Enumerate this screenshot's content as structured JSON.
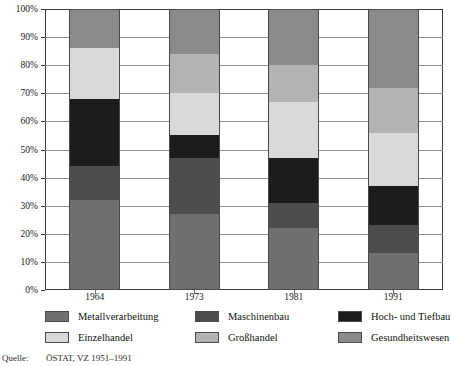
{
  "chart_data": {
    "type": "bar",
    "subtype": "stacked-100-percent",
    "title": "",
    "xlabel": "",
    "ylabel": "",
    "categories": [
      "1964",
      "1973",
      "1981",
      "1991"
    ],
    "ylim": [
      0,
      100
    ],
    "ytick_labels": [
      "0%",
      "10%",
      "20%",
      "30%",
      "40%",
      "50%",
      "60%",
      "70%",
      "80%",
      "90%",
      "100%"
    ],
    "ytick_values": [
      0,
      10,
      20,
      30,
      40,
      50,
      60,
      70,
      80,
      90,
      100
    ],
    "grid": true,
    "legend_position": "bottom",
    "series": [
      {
        "name": "Metallverarbeitung",
        "color": "#707070",
        "values": [
          32,
          27,
          22,
          13
        ]
      },
      {
        "name": "Maschinenbau",
        "color": "#4d4d4d",
        "values": [
          12,
          20,
          9,
          10
        ]
      },
      {
        "name": "Hoch- und Tiefbau",
        "color": "#1c1c1c",
        "values": [
          24,
          8,
          16,
          14
        ]
      },
      {
        "name": "Einzelhandel",
        "color": "#d9d9d9",
        "values": [
          18,
          15,
          20,
          19
        ]
      },
      {
        "name": "Großhandel",
        "color": "#b3b3b3",
        "values": [
          0,
          14,
          13,
          16
        ]
      },
      {
        "name": "Gesundheitswesen",
        "color": "#8a8a8a",
        "values": [
          14,
          16,
          20,
          28
        ]
      }
    ]
  },
  "legend": {
    "items": [
      {
        "label": "Metallverarbeitung",
        "color": "#707070"
      },
      {
        "label": "Maschinenbau",
        "color": "#4d4d4d"
      },
      {
        "label": "Hoch- und Tiefbau",
        "color": "#1c1c1c"
      },
      {
        "label": "Einzelhandel",
        "color": "#d9d9d9"
      },
      {
        "label": "Großhandel",
        "color": "#b3b3b3"
      },
      {
        "label": "Gesundheitswesen",
        "color": "#8a8a8a"
      }
    ]
  },
  "source": {
    "key": "Quelle:",
    "value": "ÖSTAT, VZ 1951–1991"
  }
}
